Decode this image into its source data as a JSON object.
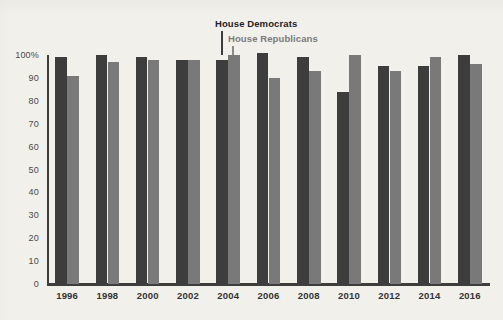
{
  "chart_data": {
    "type": "bar",
    "title": "",
    "subtitle": "",
    "xlabel": "",
    "ylabel": "",
    "ylim": [
      0,
      100
    ],
    "grid": false,
    "legend_position": "inline-annotation",
    "categories": [
      "1996",
      "1998",
      "2000",
      "2002",
      "2004",
      "2006",
      "2008",
      "2010",
      "2012",
      "2014",
      "2016"
    ],
    "y_ticks": [
      "100%",
      "90",
      "80",
      "70",
      "60",
      "50",
      "40",
      "30",
      "20",
      "10",
      "0"
    ],
    "y_tick_values": [
      100,
      90,
      80,
      70,
      60,
      50,
      40,
      30,
      20,
      10,
      0
    ],
    "series": [
      {
        "name": "House Democrats",
        "color": "#3d3d3d",
        "values": [
          99,
          100,
          99,
          98,
          98,
          101,
          99,
          84,
          95,
          95,
          100
        ]
      },
      {
        "name": "House Republicans",
        "color": "#797979",
        "values": [
          91,
          97,
          98,
          98,
          100,
          90,
          93,
          100,
          93,
          99,
          96
        ]
      }
    ],
    "annotations": [
      {
        "label": "House Democrats",
        "target_series": "House Democrats",
        "target_category": "2004"
      },
      {
        "label": "House Republicans",
        "target_series": "House Republicans",
        "target_category": "2004"
      }
    ]
  },
  "legend": {
    "democrats_label": "House Democrats",
    "republicans_label": "House Republicans"
  },
  "colors": {
    "background": "#f2f0eb",
    "democrats": "#3d3d3d",
    "republicans": "#797979",
    "axis": "#3d3d3d",
    "y_label_text": "#4a4a4a",
    "x_label_text": "#333333"
  }
}
